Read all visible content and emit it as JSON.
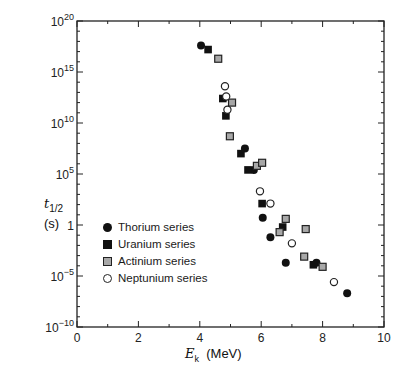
{
  "chart_data": {
    "type": "scatter",
    "title": "",
    "xlabel": "E_k (MeV)",
    "xlabel_symbol": "E",
    "xlabel_sub": "k",
    "xlabel_unit": "(MeV)",
    "ylabel": "t_1/2 (s)",
    "ylabel_symbol": "t",
    "ylabel_sub": "1/2",
    "ylabel_unit": "(s)",
    "xlim": [
      0,
      10
    ],
    "ylim_log10": [
      -10,
      20
    ],
    "y_scale": "log",
    "grid": false,
    "legend_position": "lower-left inside",
    "x_ticks": [
      0,
      2,
      4,
      6,
      8,
      10
    ],
    "y_ticks": [
      "10^-10",
      "10^-5",
      "1",
      "10^5",
      "10^10",
      "10^15",
      "10^20"
    ],
    "series": [
      {
        "name": "Thorium series",
        "marker": "filled-circle",
        "points": [
          [
            4.04,
            17.6
          ],
          [
            5.47,
            7.5
          ],
          [
            5.76,
            5.4
          ],
          [
            6.05,
            0.7
          ],
          [
            6.3,
            -1.2
          ],
          [
            6.8,
            -3.7
          ],
          [
            7.8,
            -3.7
          ],
          [
            8.8,
            -6.7
          ]
        ]
      },
      {
        "name": "Uranium series",
        "marker": "filled-square",
        "points": [
          [
            4.27,
            17.2
          ],
          [
            4.75,
            12.4
          ],
          [
            4.85,
            10.7
          ],
          [
            5.34,
            7.0
          ],
          [
            5.57,
            5.4
          ],
          [
            6.03,
            2.1
          ],
          [
            6.7,
            -0.2
          ],
          [
            7.7,
            -3.9
          ]
        ]
      },
      {
        "name": "Actinium series",
        "marker": "gray-square",
        "points": [
          [
            4.6,
            16.3
          ],
          [
            5.05,
            12.0
          ],
          [
            4.98,
            8.7
          ],
          [
            5.86,
            5.8
          ],
          [
            6.03,
            6.1
          ],
          [
            6.6,
            -0.7
          ],
          [
            6.8,
            0.6
          ],
          [
            7.4,
            -3.1
          ],
          [
            7.45,
            -0.4
          ],
          [
            8.0,
            -4.1
          ]
        ]
      },
      {
        "name": "Neptunium series",
        "marker": "open-circle",
        "points": [
          [
            4.82,
            13.6
          ],
          [
            4.86,
            12.6
          ],
          [
            4.9,
            11.3
          ],
          [
            5.96,
            3.3
          ],
          [
            6.3,
            2.1
          ],
          [
            7.0,
            -1.8
          ],
          [
            8.37,
            -5.6
          ]
        ]
      }
    ],
    "note": "y values given as log10(t_1/2 in seconds)"
  },
  "legend": {
    "items": [
      "Thorium series",
      "Uranium series",
      "Actinium series",
      "Neptunium series"
    ]
  },
  "axis": {
    "x_tick_labels": [
      "0",
      "2",
      "4",
      "6",
      "8",
      "10"
    ],
    "y_tick_labels": [
      {
        "base": "10",
        "exp": "20"
      },
      {
        "base": "10",
        "exp": "15"
      },
      {
        "base": "10",
        "exp": "10"
      },
      {
        "base": "10",
        "exp": "5"
      },
      {
        "base": "1",
        "exp": ""
      },
      {
        "base": "10",
        "exp": "−5"
      },
      {
        "base": "10",
        "exp": "−10"
      }
    ]
  }
}
